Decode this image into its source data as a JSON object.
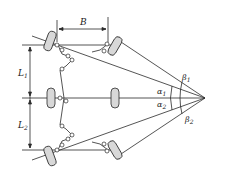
{
  "diagram": {
    "type": "multi-axle steering geometry",
    "colors": {
      "line": "#2a2a2a",
      "wheel_fill": "#d8d8d8",
      "background": "#ffffff"
    },
    "labels": {
      "B": "B",
      "L1_main": "L",
      "L1_sub": "1",
      "L2_main": "L",
      "L2_sub": "2",
      "alpha1_main": "α",
      "alpha1_sub": "1",
      "alpha2_main": "α",
      "alpha2_sub": "2",
      "beta1_main": "β",
      "beta1_sub": "1",
      "beta2_main": "β",
      "beta2_sub": "2"
    },
    "components": [
      "front-left-wheel",
      "front-right-wheel",
      "middle-left-wheel",
      "middle-right-wheel",
      "rear-left-wheel",
      "rear-right-wheel",
      "steering-linkage",
      "turning-center"
    ]
  }
}
